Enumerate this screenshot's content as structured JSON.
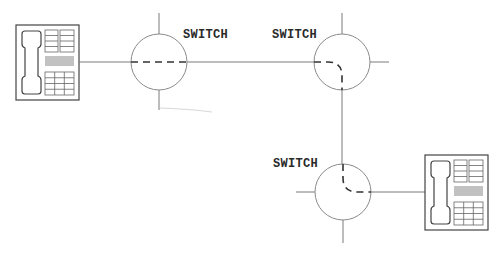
{
  "diagram": {
    "switches": [
      {
        "id": "switch-1",
        "label": "SWITCH",
        "path": "straight-horizontal"
      },
      {
        "id": "switch-2",
        "label": "SWITCH",
        "path": "left-to-bottom"
      },
      {
        "id": "switch-3",
        "label": "SWITCH",
        "path": "top-to-right"
      }
    ],
    "endpoints": [
      {
        "id": "telephone-left",
        "type": "telephone"
      },
      {
        "id": "telephone-right",
        "type": "telephone"
      }
    ],
    "colors": {
      "line": "#7a7a7a",
      "circuit_path": "#333333",
      "label": "#2a2a2a",
      "background": "#ffffff"
    }
  }
}
